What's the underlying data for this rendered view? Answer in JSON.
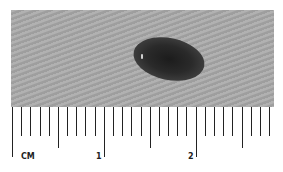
{
  "image": {
    "subject": "skin lesion (pigmented mole) beside a metric ruler",
    "skin_color": "#a8a8a8",
    "lesion_color": "#222222"
  },
  "ruler": {
    "unit_label": "CM",
    "major_labels": [
      "1",
      "2"
    ],
    "mm_ticks": 28,
    "px_per_mm": 9.18,
    "origin_x": 12
  }
}
